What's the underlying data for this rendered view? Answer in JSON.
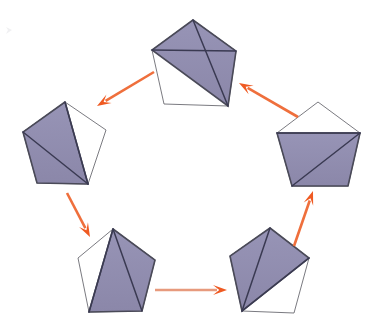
{
  "figure": {
    "canvas": {
      "width": 380,
      "height": 332,
      "background": "#ffffff"
    }
  },
  "style": {
    "shade_fill": "#8e8aae",
    "shade_fill_alt": "#9793b5",
    "outline_stroke": "#6b6b72",
    "diagonal_stroke": "#3a3a52",
    "edge_dark_stroke": "#4a4a58",
    "arrow_color": "#ef6f3c",
    "arrow_color_light": "#e79a7d",
    "arrow_head_color": "#ef5a22"
  },
  "chart_data": {
    "type": "diagram",
    "node_count": 5,
    "edge_count": 5,
    "layout": "cyclic-ring",
    "nodes": [
      {
        "id": "top",
        "name": "pentagon-top",
        "label": "",
        "position": {
          "x": 193,
          "y": 62
        },
        "vertices": [
          {
            "x": 193,
            "y": 20
          },
          {
            "x": 236,
            "y": 51
          },
          {
            "x": 228,
            "y": 106
          },
          {
            "x": 164,
            "y": 104
          },
          {
            "x": 152,
            "y": 50
          }
        ],
        "diagonals": [
          {
            "from": 0,
            "to": 2
          },
          {
            "from": 1,
            "to": 4
          }
        ],
        "shaded_polygon": [
          0,
          1,
          2,
          4
        ],
        "shaded_vertex_indices_note": "upper region: apex, right, bottom-right, left"
      },
      {
        "id": "left",
        "name": "pentagon-left",
        "label": "",
        "position": {
          "x": 64,
          "y": 144
        },
        "vertices": [
          {
            "x": 65,
            "y": 102
          },
          {
            "x": 106,
            "y": 130
          },
          {
            "x": 88,
            "y": 184
          },
          {
            "x": 37,
            "y": 183
          },
          {
            "x": 23,
            "y": 132
          }
        ],
        "diagonals": [
          {
            "from": 0,
            "to": 2
          },
          {
            "from": 4,
            "to": 2
          }
        ],
        "shaded_polygon": [
          0,
          2,
          3,
          4
        ],
        "shaded_vertex_indices_note": "left region: apex, bottom-right, bottom-left, left"
      },
      {
        "id": "right",
        "name": "pentagon-right",
        "label": "",
        "position": {
          "x": 318,
          "y": 145
        },
        "vertices": [
          {
            "x": 318,
            "y": 102
          },
          {
            "x": 360,
            "y": 133
          },
          {
            "x": 348,
            "y": 186
          },
          {
            "x": 292,
            "y": 186
          },
          {
            "x": 277,
            "y": 133
          }
        ],
        "diagonals": [
          {
            "from": 1,
            "to": 4
          },
          {
            "from": 1,
            "to": 3
          }
        ],
        "shaded_polygon": [
          1,
          2,
          3,
          4
        ],
        "shaded_vertex_indices_note": "lower region: right, bottom-right, bottom-left, left"
      },
      {
        "id": "bottom-left",
        "name": "pentagon-bottom-left",
        "label": "",
        "position": {
          "x": 114,
          "y": 271
        },
        "vertices": [
          {
            "x": 113,
            "y": 229
          },
          {
            "x": 155,
            "y": 260
          },
          {
            "x": 142,
            "y": 311
          },
          {
            "x": 89,
            "y": 312
          },
          {
            "x": 78,
            "y": 258
          }
        ],
        "diagonals": [
          {
            "from": 0,
            "to": 2
          },
          {
            "from": 0,
            "to": 3
          }
        ],
        "shaded_polygon": [
          0,
          1,
          2,
          3
        ],
        "shaded_vertex_indices_note": "right region: apex, right, bottom-right, bottom-left"
      },
      {
        "id": "bottom-right",
        "name": "pentagon-bottom-right",
        "label": "",
        "position": {
          "x": 269,
          "y": 270
        },
        "vertices": [
          {
            "x": 270,
            "y": 228
          },
          {
            "x": 309,
            "y": 258
          },
          {
            "x": 294,
            "y": 313
          },
          {
            "x": 242,
            "y": 311
          },
          {
            "x": 230,
            "y": 256
          }
        ],
        "diagonals": [
          {
            "from": 0,
            "to": 3
          },
          {
            "from": 1,
            "to": 3
          }
        ],
        "shaded_polygon": [
          0,
          1,
          3,
          4
        ],
        "shaded_vertex_indices_note": "upper-left region: apex, right, bottom-left, left"
      }
    ],
    "edges": [
      {
        "id": "arrow-top-to-left",
        "name": "arrow-top-to-left",
        "from": "top",
        "to": "left",
        "label": "",
        "start": {
          "x": 154,
          "y": 72
        },
        "end": {
          "x": 97,
          "y": 106
        },
        "direction": "down-left"
      },
      {
        "id": "arrow-left-to-bottom-left",
        "name": "arrow-left-to-bottom-left",
        "from": "left",
        "to": "bottom-left",
        "label": "",
        "start": {
          "x": 67,
          "y": 193
        },
        "end": {
          "x": 90,
          "y": 237
        },
        "direction": "down-right"
      },
      {
        "id": "arrow-bottom-left-to-bottom-right",
        "name": "arrow-bottom-left-to-bottom-right",
        "from": "bottom-left",
        "to": "bottom-right",
        "label": "",
        "start": {
          "x": 155,
          "y": 290
        },
        "end": {
          "x": 227,
          "y": 290
        },
        "direction": "right"
      },
      {
        "id": "arrow-bottom-right-to-right",
        "name": "arrow-bottom-right-to-right",
        "from": "bottom-right",
        "to": "right",
        "label": "",
        "start": {
          "x": 294,
          "y": 246
        },
        "end": {
          "x": 313,
          "y": 191
        },
        "direction": "up-right"
      },
      {
        "id": "arrow-right-to-top",
        "name": "arrow-right-to-top",
        "from": "right",
        "to": "top",
        "label": "",
        "start": {
          "x": 298,
          "y": 117
        },
        "end": {
          "x": 239,
          "y": 83
        },
        "direction": "up-left"
      }
    ],
    "annotations": [],
    "legend": [],
    "xlabel": "",
    "ylabel": ""
  }
}
